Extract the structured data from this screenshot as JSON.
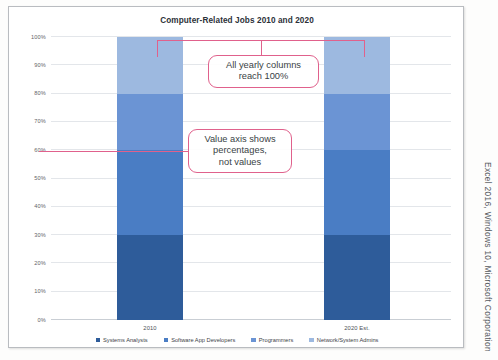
{
  "chart": {
    "title": "Computer-Related Jobs 2010 and 2020"
  },
  "credit": "Excel 2016, Windows 10, Microsoft Corporation",
  "annotations": [
    {
      "id": "reach-100",
      "text": "All yearly columns\nreach 100%"
    },
    {
      "id": "value-axis",
      "text": "Value axis shows\npercentages,\nnot values"
    }
  ],
  "annotation_lines": {
    "reach_100_line1": "All yearly columns",
    "reach_100_line2": "reach 100%",
    "value_axis_line1": "Value axis shows",
    "value_axis_line2": "percentages,",
    "value_axis_line3": "not values"
  },
  "colors": {
    "systems_analysts": "#2e5c9a",
    "software_app_developers": "#4a7dc4",
    "programmers": "#6b94d4",
    "network_system_admins": "#9db9e0",
    "annotation": "#e0618c",
    "gridline": "#e3e6ea",
    "frame": "#b9bcc0"
  },
  "chart_data": {
    "type": "bar",
    "subtype": "100% stacked column",
    "title": "Computer-Related Jobs 2010 and 2020",
    "xlabel": "",
    "ylabel": "",
    "categories": [
      "2010",
      "2020 Est."
    ],
    "ylim": [
      0,
      100
    ],
    "ytick_labels": [
      "0%",
      "10%",
      "20%",
      "30%",
      "40%",
      "50%",
      "60%",
      "70%",
      "80%",
      "90%",
      "100%"
    ],
    "ytick_values": [
      0,
      10,
      20,
      30,
      40,
      50,
      60,
      70,
      80,
      90,
      100
    ],
    "grid": true,
    "legend_position": "bottom",
    "series": [
      {
        "name": "Systems Analysts",
        "color": "#2e5c9a",
        "values": [
          30,
          30
        ]
      },
      {
        "name": "Software App Developers",
        "color": "#4a7dc4",
        "values": [
          30,
          30
        ]
      },
      {
        "name": "Programmers",
        "color": "#6b94d4",
        "values": [
          20,
          20
        ]
      },
      {
        "name": "Network/System Admins",
        "color": "#9db9e0",
        "values": [
          20,
          20
        ]
      }
    ],
    "stack_totals": [
      100,
      100
    ]
  }
}
